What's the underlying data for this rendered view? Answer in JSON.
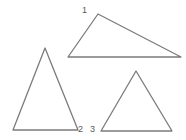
{
  "figure": {
    "background_color": "#ffffff",
    "stroke_color": "#7b7b7b",
    "label_color": "#585858",
    "width": 186,
    "height": 140
  },
  "shapes": [
    {
      "name": "obtuse-triangle-top-right",
      "points": "98,14 181,57 68,57",
      "vertices": [
        [
          98,
          14
        ],
        [
          181,
          57
        ],
        [
          68,
          57
        ]
      ]
    },
    {
      "name": "tall-triangle-left",
      "points": "45,48 78,130 13,130",
      "vertices": [
        [
          45,
          48
        ],
        [
          78,
          130
        ],
        [
          13,
          130
        ]
      ]
    },
    {
      "name": "triangle-bottom-right",
      "points": "136,71 172,131 101,131",
      "vertices": [
        [
          136,
          71
        ],
        [
          172,
          131
        ],
        [
          101,
          131
        ]
      ]
    }
  ],
  "labels": {
    "one": "1",
    "two": "2",
    "three": "3"
  }
}
